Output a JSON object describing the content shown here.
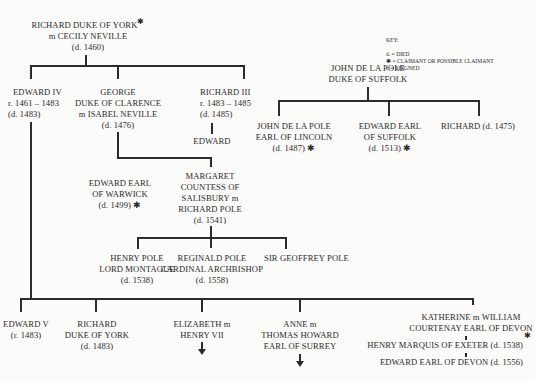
{
  "key": {
    "title": "KEY:",
    "items": [
      "d. = DIED",
      "✱ = CLAIMANT OR POSSIBLE CLAIMANT",
      "r. = REIGNED"
    ]
  },
  "people": {
    "richard_york": {
      "lines": [
        "RICHARD DUKE OF YORK",
        "m CECILY NEVILLE",
        "(d. 1460)"
      ],
      "claimant": "✱"
    },
    "edward_iv": {
      "lines": [
        "EDWARD IV",
        "r. 1461 – 1483",
        "(d. 1483)"
      ]
    },
    "george": {
      "lines": [
        "GEORGE",
        "DUKE OF CLARENCE",
        "m  ISABEL NEVILLE",
        "(d. 1476)"
      ]
    },
    "richard_iii": {
      "lines": [
        "RICHARD III",
        "r. 1483 – 1485",
        "(d. 1485)"
      ]
    },
    "edward_son_r3": {
      "lines": [
        "EDWARD"
      ]
    },
    "john_suffolk": {
      "lines": [
        "JOHN DE LA POLE",
        "DUKE OF SUFFOLK"
      ]
    },
    "john_lincoln": {
      "lines": [
        "JOHN DE LA POLE",
        "EARL OF LINCOLN",
        "(d. 1487) ✱"
      ]
    },
    "edward_suffolk": {
      "lines": [
        "EDWARD EARL",
        "OF SUFFOLK",
        "(d. 1513) ✱"
      ]
    },
    "richard_1475": {
      "lines": [
        "RICHARD (d. 1475)"
      ]
    },
    "edward_warwick": {
      "lines": [
        "EDWARD EARL",
        "OF WARWICK",
        "(d. 1499) ✱"
      ]
    },
    "margaret": {
      "lines": [
        "MARGARET",
        "COUNTESS OF",
        "SALISBURY m",
        "RICHARD POLE",
        "(d. 1541)"
      ]
    },
    "henry_pole": {
      "lines": [
        "HENRY POLE",
        "LORD MONTAGUE",
        "(d. 1538)"
      ]
    },
    "reginald_pole": {
      "lines": [
        "REGINALD POLE",
        "CARDINAL ARCHBISHOP",
        "(d. 1558)"
      ]
    },
    "geoffrey_pole": {
      "lines": [
        "SIR GEOFFREY POLE"
      ]
    },
    "edward_v": {
      "lines": [
        "EDWARD V",
        "(r. 1483)"
      ]
    },
    "richard_york_jr": {
      "lines": [
        "RICHARD",
        "DUKE OF YORK",
        "(d. 1483)"
      ]
    },
    "elizabeth": {
      "lines": [
        "ELIZABETH m",
        "HENRY VII"
      ]
    },
    "anne": {
      "lines": [
        "ANNE m",
        "THOMAS HOWARD",
        "EARL OF SURREY"
      ]
    },
    "katherine": {
      "lines": [
        "KATHERINE m WILLIAM",
        "COURTENAY EARL OF DEVON"
      ]
    },
    "henry_exeter": {
      "lines": [
        "HENRY MARQUIS OF EXETER (d. 1538)"
      ],
      "claimant": "✱"
    },
    "edward_devon": {
      "lines": [
        "EDWARD EARL OF DEVON (d. 1556)"
      ]
    }
  }
}
